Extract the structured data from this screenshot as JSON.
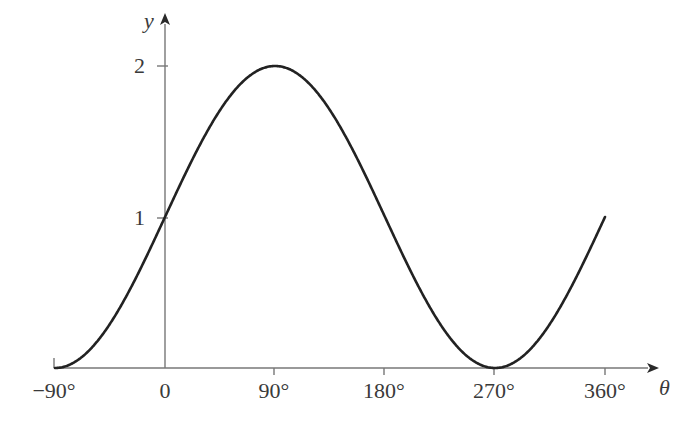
{
  "figure": {
    "background": "#ffffff",
    "curve_color": "#222222",
    "axis_color": "#777777",
    "text_color": "#3a3a3a"
  },
  "axes": {
    "x_axis_label": "θ",
    "y_axis_label": "y",
    "x_tick_labels": [
      "−90°",
      "0",
      "90°",
      "180°",
      "270°",
      "360°"
    ],
    "y_tick_labels": [
      "1",
      "2"
    ]
  },
  "chart_data": {
    "type": "line",
    "title": "",
    "xlabel": "θ",
    "ylabel": "y",
    "xlim": [
      -90,
      360
    ],
    "ylim": [
      0,
      2.25
    ],
    "grid": false,
    "legend": "none",
    "equation": "y = 1 + sin(θ)",
    "xticks": [
      -90,
      0,
      90,
      180,
      270,
      360
    ],
    "xticklabels": [
      "−90°",
      "0",
      "90°",
      "180°",
      "270°",
      "360°"
    ],
    "yticks": [
      1,
      2
    ],
    "yticklabels": [
      "1",
      "2"
    ],
    "series": [
      {
        "name": "y = 1 + sin(θ)",
        "color": "#222222",
        "x": [
          -90,
          -75,
          -60,
          -45,
          -30,
          -15,
          0,
          15,
          30,
          45,
          60,
          75,
          90,
          105,
          120,
          135,
          150,
          165,
          180,
          195,
          210,
          225,
          240,
          255,
          270,
          285,
          300,
          315,
          330,
          345,
          360
        ],
        "y": [
          0,
          0.034,
          0.134,
          0.293,
          0.5,
          0.741,
          1,
          1.259,
          1.5,
          1.707,
          1.866,
          1.966,
          2,
          1.966,
          1.866,
          1.707,
          1.5,
          1.259,
          1,
          0.741,
          0.5,
          0.293,
          0.134,
          0.034,
          0,
          0.034,
          0.134,
          0.293,
          0.5,
          0.741,
          1
        ]
      }
    ],
    "key_points": [
      {
        "label": "start",
        "x": -90,
        "y": 0
      },
      {
        "label": "y-intercept",
        "x": 0,
        "y": 1
      },
      {
        "label": "maximum",
        "x": 90,
        "y": 2
      },
      {
        "label": "midline",
        "x": 180,
        "y": 1
      },
      {
        "label": "minimum",
        "x": 270,
        "y": 0
      },
      {
        "label": "end",
        "x": 360,
        "y": 1
      }
    ]
  }
}
